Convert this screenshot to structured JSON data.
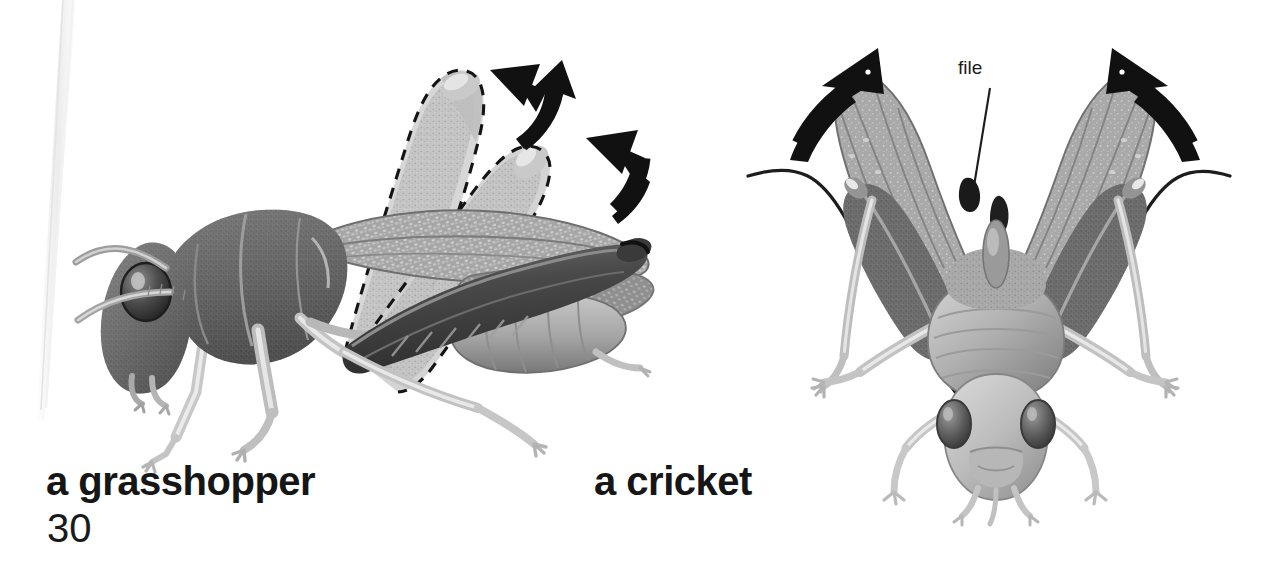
{
  "page": {
    "background_color": "#ffffff",
    "width": 1266,
    "height": 567,
    "page_number": "30",
    "media_type": "scanned-book-page"
  },
  "figures": [
    {
      "id": "grasshopper",
      "caption": "a grasshopper",
      "view": "lateral side view, head facing left",
      "annotation_style": "dashed ghost outlines with solid black motion arrows",
      "motion_arrows": 2,
      "ghost_outlines": 2
    },
    {
      "id": "cricket",
      "caption": "a cricket",
      "view": "frontal view, wings raised",
      "annotation_style": "solid black motion arrows and leader-line label",
      "motion_arrows": 2,
      "labels": [
        {
          "text": "file",
          "target": "dark ridged stridulation organ at base of raised wing"
        }
      ]
    }
  ],
  "captions": {
    "grasshopper": "a grasshopper",
    "cricket": "a cricket"
  },
  "labels": {
    "file": "file"
  },
  "colors": {
    "ink_black": "#161616",
    "arrow_black": "#111111",
    "body_mid_gray": "#9a9a9a",
    "body_dark_gray": "#5d5d5d",
    "body_light_gray": "#cfcfcf",
    "wing_gray": "#a8a8a8",
    "page_edge_gray": "#ededed",
    "background": "#ffffff"
  }
}
